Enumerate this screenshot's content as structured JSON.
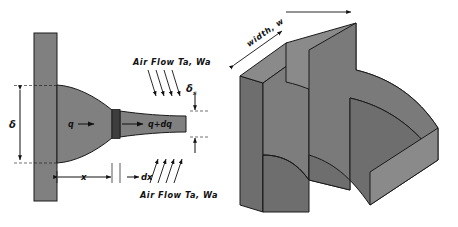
{
  "figure": {
    "views": [
      "cross-section",
      "isometric"
    ]
  },
  "colors": {
    "fin_fill": "#808080",
    "fin_fill_light": "#8a8a8a",
    "fin_fill_dark": "#6e6e6e",
    "element_fill": "#3d3d3d",
    "outline": "#1a1a1a",
    "background": "#ffffff",
    "text": "#111111"
  },
  "section_view": {
    "airflow_top": {
      "label": "Air Flow Ta, Wa",
      "arrow_count": 4,
      "direction": "down-right"
    },
    "airflow_bottom": {
      "label": "Air Flow Ta, Wa",
      "arrow_count": 4,
      "direction": "up-right"
    },
    "heat_in": {
      "label": "q",
      "direction": "right"
    },
    "heat_out": {
      "label": "q+dq",
      "direction": "right"
    },
    "base_thickness": {
      "label": "δ"
    },
    "tip_thickness": {
      "label": "δ",
      "subscript": "s"
    },
    "distance": {
      "label": "x"
    },
    "increment": {
      "label": "dx"
    }
  },
  "iso_view": {
    "width_dimension": {
      "label": "width, w"
    }
  }
}
